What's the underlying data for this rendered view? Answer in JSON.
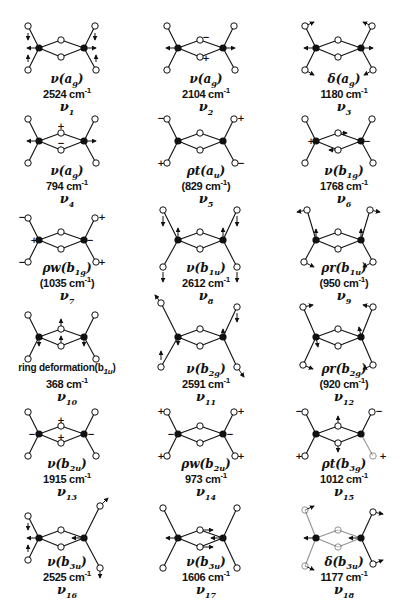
{
  "figure": {
    "colors": {
      "ink": "#111111",
      "open_atom_fill": "#ffffff",
      "heavy_atom_fill": "#111111",
      "background": "#ffffff"
    },
    "modes": [
      {
        "id": "v1",
        "symbol": "ν",
        "species": "a",
        "species_sub": "g",
        "freq": "2524 cm",
        "freq_sup": "-1",
        "nu": "ν",
        "nu_sub": "1",
        "col": 0,
        "row": 0,
        "variant": "a"
      },
      {
        "id": "v2",
        "symbol": "ν",
        "species": "a",
        "species_sub": "g",
        "freq": "2104 cm",
        "freq_sup": "-1",
        "nu": "ν",
        "nu_sub": "2",
        "col": 1,
        "row": 0,
        "variant": "b"
      },
      {
        "id": "v3",
        "symbol": "δ",
        "species": "a",
        "species_sub": "g",
        "freq": "1180 cm",
        "freq_sup": "-1",
        "nu": "ν",
        "nu_sub": "3",
        "col": 2,
        "row": 0,
        "variant": "c"
      },
      {
        "id": "v4",
        "symbol": "ν",
        "species": "a",
        "species_sub": "g",
        "freq": "794 cm",
        "freq_sup": "-1",
        "nu": "ν",
        "nu_sub": "4",
        "col": 0,
        "row": 1,
        "variant": "d"
      },
      {
        "id": "v5",
        "symbol": "ρt",
        "species": "a",
        "species_sub": "u",
        "freq": "(829 cm",
        "freq_sup": "-1",
        "freq_close": ")",
        "nu": "ν",
        "nu_sub": "5",
        "col": 1,
        "row": 1,
        "variant": "e"
      },
      {
        "id": "v6",
        "symbol": "ν",
        "species": "b",
        "species_sub": "1g",
        "freq": "1768 cm",
        "freq_sup": "-1",
        "nu": "ν",
        "nu_sub": "6",
        "col": 2,
        "row": 1,
        "variant": "f"
      },
      {
        "id": "v7",
        "symbol": "ρw",
        "species": "b",
        "species_sub": "1g",
        "freq": "(1035 cm",
        "freq_sup": "-1",
        "freq_close": ")",
        "nu": "ν",
        "nu_sub": "7",
        "col": 0,
        "row": 2,
        "variant": "g"
      },
      {
        "id": "v8",
        "symbol": "ν",
        "species": "b",
        "species_sub": "1u",
        "freq": "2612 cm",
        "freq_sup": "-1",
        "nu": "ν",
        "nu_sub": "8",
        "col": 1,
        "row": 2,
        "variant": "h"
      },
      {
        "id": "v9",
        "symbol": "ρr",
        "species": "b",
        "species_sub": "1u",
        "freq": "(950 cm",
        "freq_sup": "-1",
        "freq_close": ")",
        "nu": "ν",
        "nu_sub": "9",
        "col": 2,
        "row": 2,
        "variant": "i"
      },
      {
        "id": "v10",
        "symbol": "ring deformation",
        "species": "b",
        "species_sub": "1u",
        "freq": "368 cm",
        "freq_sup": "-1",
        "nu": "ν",
        "nu_sub": "10",
        "col": 0,
        "row": 3,
        "variant": "j",
        "long": true
      },
      {
        "id": "v11",
        "symbol": "ν",
        "species": "b",
        "species_sub": "2g",
        "freq": "2591 cm",
        "freq_sup": "-1",
        "nu": "ν",
        "nu_sub": "11",
        "col": 1,
        "row": 3,
        "variant": "k"
      },
      {
        "id": "v12",
        "symbol": "ρr",
        "species": "b",
        "species_sub": "2g",
        "freq": "(920 cm",
        "freq_sup": "-1",
        "freq_close": ")",
        "nu": "ν",
        "nu_sub": "12",
        "col": 2,
        "row": 3,
        "variant": "l"
      },
      {
        "id": "v13",
        "symbol": "ν",
        "species": "b",
        "species_sub": "2u",
        "freq": "1915 cm",
        "freq_sup": "-1",
        "nu": "ν",
        "nu_sub": "13",
        "col": 0,
        "row": 4,
        "variant": "m"
      },
      {
        "id": "v14",
        "symbol": "ρw",
        "species": "b",
        "species_sub": "2u",
        "freq": "973 cm",
        "freq_sup": "-1",
        "nu": "ν",
        "nu_sub": "14",
        "col": 1,
        "row": 4,
        "variant": "n"
      },
      {
        "id": "v15",
        "symbol": "ρt",
        "species": "b",
        "species_sub": "3g",
        "freq": "1012 cm",
        "freq_sup": "-1",
        "nu": "ν",
        "nu_sub": "15",
        "col": 2,
        "row": 4,
        "variant": "o"
      },
      {
        "id": "v16",
        "symbol": "ν",
        "species": "b",
        "species_sub": "3u",
        "freq": "2525 cm",
        "freq_sup": "-1",
        "nu": "ν",
        "nu_sub": "16",
        "col": 0,
        "row": 5,
        "variant": "p"
      },
      {
        "id": "v17",
        "symbol": "ν",
        "species": "b",
        "species_sub": "3u",
        "freq": "1606 cm",
        "freq_sup": "-1",
        "nu": "ν",
        "nu_sub": "17",
        "col": 1,
        "row": 5,
        "variant": "q"
      },
      {
        "id": "v18",
        "symbol": "δ",
        "species": "b",
        "species_sub": "3u",
        "freq": "1177 cm",
        "freq_sup": "-1",
        "nu": "ν",
        "nu_sub": "18",
        "col": 2,
        "row": 5,
        "variant": "r"
      }
    ],
    "layout": {
      "col_x": [
        0,
        139,
        277
      ],
      "row_y": [
        0,
        93,
        192,
        289,
        386,
        490
      ],
      "label_top": [
        73,
        72,
        70,
        74,
        72,
        66
      ]
    }
  }
}
